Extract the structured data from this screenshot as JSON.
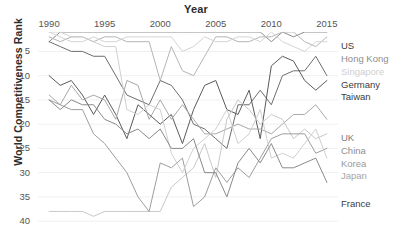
{
  "chart_data": {
    "type": "line",
    "title": "",
    "xlabel": "Year",
    "ylabel": "World Competitiveness Rank",
    "xticks": [
      1990,
      1995,
      2000,
      2005,
      2010,
      2015
    ],
    "yticks": [
      5,
      10,
      15,
      20,
      25,
      30,
      35,
      40
    ],
    "xlim": [
      1989,
      2016
    ],
    "ylim": [
      1,
      41
    ],
    "y_inverted": true,
    "grid": "horizontal-light",
    "legend_position": "right-inline",
    "x": [
      1990,
      1991,
      1992,
      1993,
      1994,
      1995,
      1996,
      1997,
      1998,
      1999,
      2000,
      2001,
      2002,
      2003,
      2004,
      2005,
      2006,
      2007,
      2008,
      2009,
      2010,
      2011,
      2012,
      2013,
      2014,
      2015
    ],
    "series": [
      {
        "name": "US",
        "color": "#8c8c8c",
        "values": [
          3,
          1,
          1,
          1,
          1,
          1,
          1,
          1,
          1,
          1,
          1,
          1,
          1,
          1,
          1,
          1,
          1,
          1,
          1,
          1,
          3,
          1,
          2,
          1,
          1,
          1
        ]
      },
      {
        "name": "Hong Kong",
        "color": "#b5b5b5",
        "values": [
          2,
          3,
          2,
          2,
          3,
          2,
          2,
          3,
          3,
          3,
          11,
          4,
          9,
          10,
          6,
          2,
          2,
          3,
          3,
          2,
          2,
          1,
          1,
          3,
          4,
          2
        ]
      },
      {
        "name": "Singapore",
        "color": "#d4d4d4",
        "values": [
          1,
          2,
          3,
          3,
          2,
          3,
          3,
          2,
          2,
          2,
          2,
          2,
          5,
          4,
          2,
          3,
          3,
          2,
          2,
          3,
          1,
          3,
          4,
          5,
          3,
          3
        ]
      },
      {
        "name": "Germany",
        "color": "#6e6e6e",
        "values": [
          3,
          4,
          5,
          5,
          6,
          6,
          10,
          14,
          15,
          16,
          11,
          12,
          15,
          20,
          21,
          23,
          25,
          16,
          16,
          13,
          16,
          10,
          9,
          9,
          6,
          10
        ]
      },
      {
        "name": "Taiwan",
        "color": "#5a5a5a",
        "values": [
          10,
          12,
          11,
          14,
          18,
          14,
          18,
          23,
          16,
          18,
          20,
          18,
          24,
          17,
          12,
          11,
          17,
          18,
          13,
          23,
          8,
          6,
          7,
          11,
          13,
          11
        ]
      },
      {
        "name": "UK",
        "color": "#a8a8a8",
        "values": [
          14,
          16,
          12,
          15,
          14,
          15,
          19,
          11,
          12,
          19,
          15,
          19,
          16,
          19,
          22,
          22,
          21,
          20,
          21,
          21,
          22,
          20,
          18,
          18,
          16,
          19
        ]
      },
      {
        "name": "China",
        "color": "#c9c9c9",
        "values": [
          38,
          38,
          38,
          38,
          39,
          38,
          38,
          38,
          38,
          38,
          38,
          33,
          31,
          29,
          24,
          31,
          19,
          15,
          17,
          20,
          18,
          19,
          23,
          21,
          23,
          22
        ]
      },
      {
        "name": "Korea",
        "color": "#9e9e9e",
        "values": [
          15,
          16,
          17,
          17,
          22,
          24,
          27,
          30,
          35,
          38,
          28,
          29,
          27,
          37,
          35,
          29,
          32,
          29,
          31,
          27,
          23,
          22,
          22,
          22,
          26,
          25
        ]
      },
      {
        "name": "Japan",
        "color": "#d0d0d0",
        "values": [
          1,
          1,
          2,
          2,
          3,
          4,
          4,
          17,
          18,
          16,
          17,
          26,
          30,
          25,
          23,
          21,
          17,
          24,
          22,
          17,
          27,
          26,
          27,
          24,
          21,
          27
        ]
      },
      {
        "name": "France",
        "color": "#8a8a8a",
        "values": [
          15,
          17,
          15,
          16,
          16,
          19,
          20,
          22,
          21,
          23,
          21,
          25,
          25,
          23,
          30,
          30,
          35,
          28,
          25,
          28,
          24,
          29,
          29,
          28,
          27,
          32
        ]
      }
    ],
    "series_labels": [
      {
        "name": "US",
        "top": 41,
        "color": "#3b3b3b"
      },
      {
        "name": "Hong Kong",
        "top": 54,
        "color": "#8e8e8e"
      },
      {
        "name": "Singapore",
        "top": 67,
        "color": "#cfcfcf"
      },
      {
        "name": "Germany",
        "top": 80,
        "color": "#3b3b3b"
      },
      {
        "name": "Taiwan",
        "top": 92,
        "color": "#3b3b3b"
      },
      {
        "name": "UK",
        "top": 133,
        "color": "#7d7d7d"
      },
      {
        "name": "China",
        "top": 146,
        "color": "#8e8e8e"
      },
      {
        "name": "Korea",
        "top": 159,
        "color": "#9a9a9a"
      },
      {
        "name": "Japan",
        "top": 171,
        "color": "#a5a5a5"
      },
      {
        "name": "France",
        "top": 199,
        "color": "#3b3b3b"
      }
    ]
  }
}
